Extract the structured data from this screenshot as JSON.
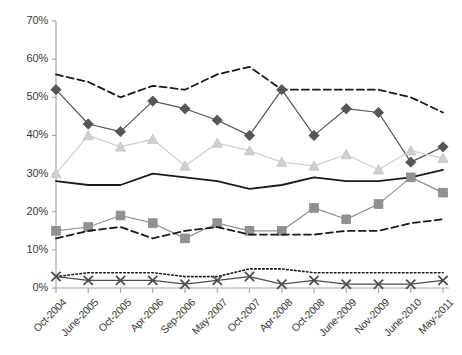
{
  "chart_data": {
    "type": "line",
    "title": "",
    "subtitle": "",
    "xlabel": "",
    "ylabel": "",
    "ylim": [
      0,
      70
    ],
    "ytick_labels": [
      "0%",
      "10%",
      "20%",
      "30%",
      "40%",
      "50%",
      "60%",
      "70%"
    ],
    "ytick_values": [
      0,
      10,
      20,
      30,
      40,
      50,
      60,
      70
    ],
    "ytick_step": 10,
    "grid": false,
    "legend_position": "none",
    "categories": [
      "Oct-2004",
      "June-2005",
      "Oct-2005",
      "Apr-2006",
      "Sep-2006",
      "May-2007",
      "Oct-2007",
      "Apr-2008",
      "Oct-2008",
      "June-2009",
      "Nov-2009",
      "June-2010",
      "May-2011"
    ],
    "series": [
      {
        "name": "Top dashed line",
        "marker": "none",
        "line_style": "dashed",
        "color": "#1a1a1a",
        "values": [
          56,
          54,
          50,
          53,
          52,
          56,
          58,
          52,
          52,
          52,
          52,
          50,
          46
        ]
      },
      {
        "name": "Dark diamond series",
        "marker": "diamond",
        "line_style": "solid",
        "color": "#565656",
        "values": [
          52,
          43,
          41,
          49,
          47,
          44,
          40,
          52,
          40,
          47,
          46,
          33,
          37
        ]
      },
      {
        "name": "Light triangle series",
        "marker": "triangle",
        "line_style": "solid",
        "color": "#cfcfcf",
        "values": [
          30,
          40,
          37,
          39,
          32,
          38,
          36,
          33,
          32,
          35,
          31,
          36,
          34
        ]
      },
      {
        "name": "Solid mid line",
        "marker": "none",
        "line_style": "solid",
        "color": "#1a1a1a",
        "values": [
          28,
          27,
          27,
          30,
          29,
          28,
          26,
          27,
          29,
          28,
          28,
          29,
          31
        ]
      },
      {
        "name": "Gray square series",
        "marker": "square",
        "line_style": "solid",
        "color": "#919191",
        "values": [
          15,
          16,
          19,
          17,
          13,
          17,
          15,
          15,
          21,
          18,
          22,
          29,
          25
        ]
      },
      {
        "name": "Lower dashed line",
        "marker": "none",
        "line_style": "dashed",
        "color": "#1a1a1a",
        "values": [
          13,
          15,
          16,
          13,
          15,
          16,
          14,
          14,
          14,
          15,
          15,
          17,
          18
        ]
      },
      {
        "name": "Dotted line",
        "marker": "none",
        "line_style": "dotted",
        "color": "#1a1a1a",
        "values": [
          3,
          4,
          4,
          4,
          3,
          3,
          5,
          5,
          4,
          4,
          4,
          4,
          4
        ]
      },
      {
        "name": "X marker series",
        "marker": "x",
        "line_style": "solid",
        "color": "#4d4d4d",
        "values": [
          3,
          2,
          2,
          2,
          1,
          2,
          3,
          1,
          2,
          1,
          1,
          1,
          2
        ]
      }
    ]
  }
}
